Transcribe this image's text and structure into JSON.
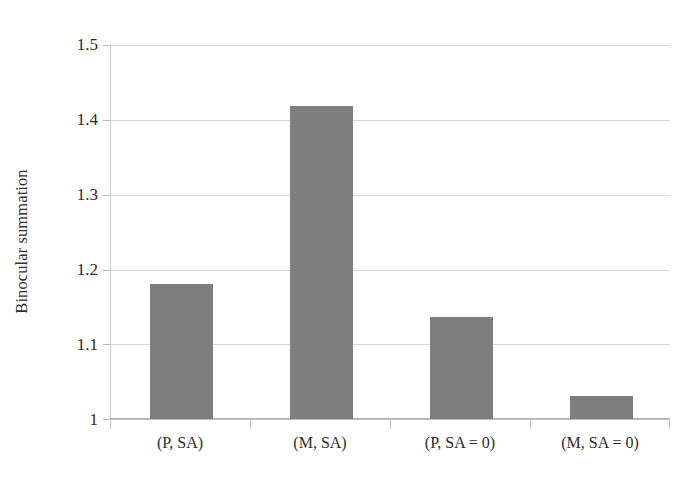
{
  "chart_data": {
    "type": "bar",
    "title": "",
    "xlabel": "",
    "ylabel": "Binocular summation",
    "categories": [
      "(P, SA)",
      "(M, SA)",
      "(P, SA = 0)",
      "(M, SA = 0)"
    ],
    "values": [
      1.18,
      1.418,
      1.136,
      1.031
    ],
    "ylim": [
      1,
      1.5
    ],
    "ytick_labels": [
      "1.5",
      "1.4",
      "1.3",
      "1.2",
      "1.1",
      "1"
    ],
    "ytick_values": [
      1.5,
      1.4,
      1.3,
      1.2,
      1.1,
      1.0
    ],
    "grid": true,
    "legend": "none",
    "bar_color": "#7e7e7e",
    "gridline_color": "#d9d9d9",
    "axis_color": "#bdbdbd",
    "background_color": "#ffffff"
  }
}
